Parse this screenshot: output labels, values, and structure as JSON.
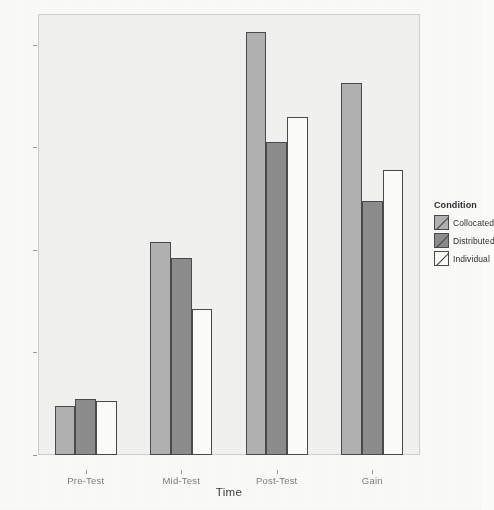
{
  "chart_data": {
    "type": "bar",
    "title": "",
    "xlabel": "Time",
    "ylabel": "Score",
    "categories": [
      "Pre-Test",
      "Mid-Test",
      "Post-Test",
      "Gain"
    ],
    "series": [
      {
        "name": "Collocated",
        "values": [
          0.95,
          4.15,
          8.25,
          7.25
        ]
      },
      {
        "name": "Distributed",
        "values": [
          1.1,
          3.85,
          6.1,
          4.95
        ]
      },
      {
        "name": "Individual",
        "values": [
          1.05,
          2.85,
          6.6,
          5.55
        ]
      }
    ],
    "ylim": [
      0,
      8.6
    ],
    "yticks": [
      "0",
      "2",
      "4",
      "6",
      "8"
    ],
    "ytick_values": [
      0,
      2,
      4,
      6,
      8
    ],
    "grid": false,
    "legend": {
      "title": "Condition",
      "position": "right",
      "entries": [
        "Collocated",
        "Distributed",
        "Individual"
      ]
    },
    "colors": {
      "collocated": "#b2b2b2",
      "distributed": "#8d8d8d",
      "individual": "#fdfdfc",
      "bar_outline": "#4a4a4a",
      "panel_background": "#f2f2f0",
      "figure_background": "#fbfbfa",
      "axis_text": "#7d7d7d"
    }
  }
}
